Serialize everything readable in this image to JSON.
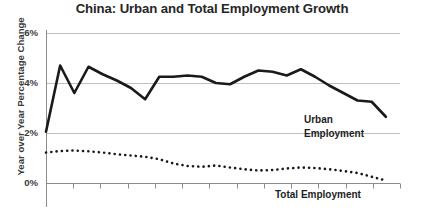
{
  "chart_data": {
    "type": "line",
    "title": "China: Urban and Total Employment Growth",
    "xlabel": "",
    "ylabel": "Year over Year Percentage Change",
    "ylim": [
      0,
      6
    ],
    "yticks": [
      0,
      2,
      4,
      6
    ],
    "ytick_labels": [
      "0%",
      "2%",
      "4%",
      "6%"
    ],
    "grid": true,
    "legend_position": "inline-annotation",
    "xlim": [
      0,
      25
    ],
    "x_tick_count": 14,
    "series": [
      {
        "name": "Urban Employment",
        "style": "solid",
        "color": "#1a1a1a",
        "x": [
          0,
          1,
          2,
          3,
          4,
          5,
          6,
          7,
          8,
          9,
          10,
          11,
          12,
          13,
          14,
          15,
          16,
          17,
          18,
          19,
          20,
          21,
          22,
          23,
          24
        ],
        "values": [
          2.05,
          4.7,
          3.6,
          4.65,
          4.35,
          4.1,
          3.8,
          3.35,
          4.25,
          4.25,
          4.3,
          4.25,
          4.0,
          3.95,
          4.25,
          4.5,
          4.45,
          4.3,
          4.55,
          4.25,
          3.9,
          3.6,
          3.3,
          3.25,
          2.65
        ]
      },
      {
        "name": "Total Employment",
        "style": "dotted",
        "color": "#1a1a1a",
        "x": [
          0,
          1,
          2,
          3,
          4,
          5,
          6,
          7,
          8,
          9,
          10,
          11,
          12,
          13,
          14,
          15,
          16,
          17,
          18,
          19,
          20,
          21,
          22,
          23,
          24
        ],
        "values": [
          1.22,
          1.28,
          1.3,
          1.27,
          1.22,
          1.15,
          1.1,
          1.05,
          0.95,
          0.78,
          0.68,
          0.65,
          0.7,
          0.62,
          0.55,
          0.5,
          0.52,
          0.58,
          0.62,
          0.6,
          0.55,
          0.48,
          0.4,
          0.25,
          0.1
        ]
      }
    ],
    "annotations": [
      {
        "name": "urban-employment-label",
        "line1": "Urban",
        "line2": "Employment"
      },
      {
        "name": "total-employment-label",
        "text": "Total Employment"
      }
    ]
  },
  "colors": {
    "line": "#1a1a1a",
    "grid": "#bfbfbf",
    "axis": "#8c8c8c",
    "title": "#262626",
    "text": "#3a3a3a"
  }
}
